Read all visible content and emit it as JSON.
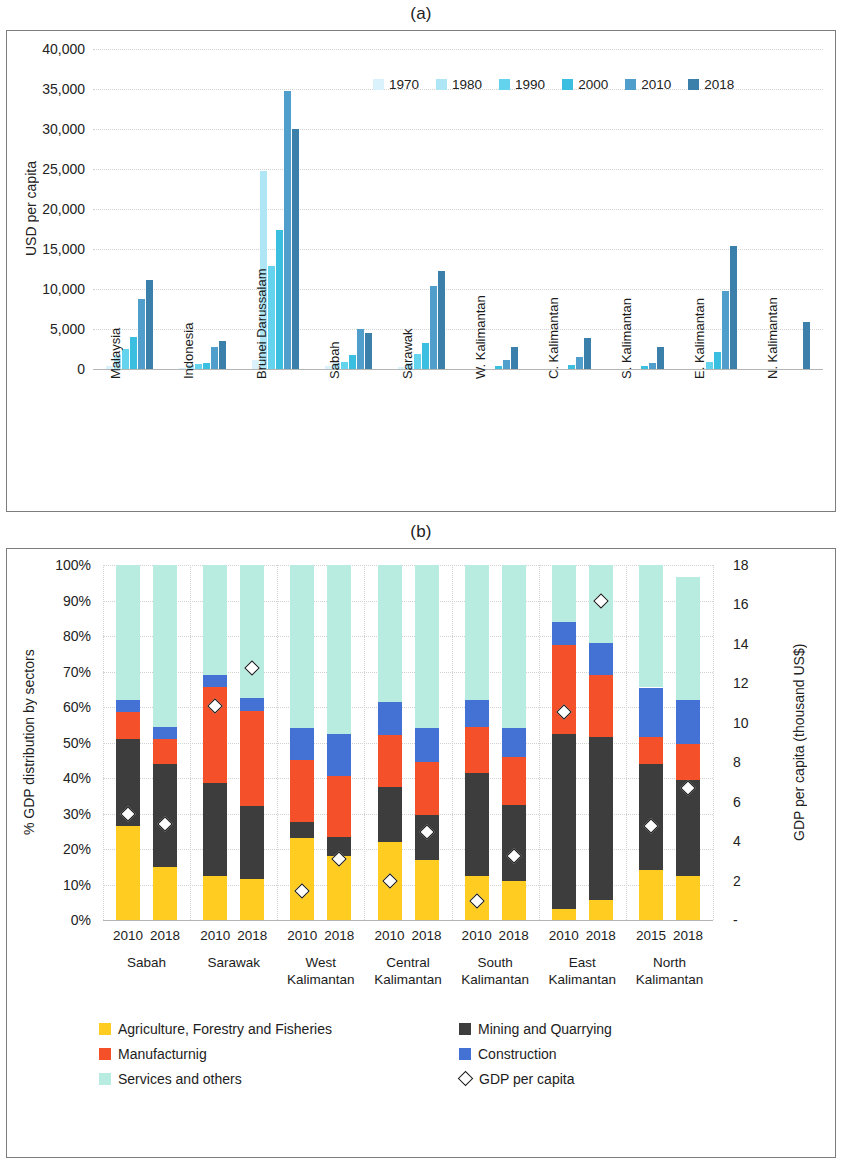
{
  "figure": {
    "panel_a_caption": "(a)",
    "panel_b_caption": "(b)"
  },
  "chart_data": [
    {
      "type": "bar",
      "id": "a",
      "title": "(a)",
      "xlabel": "",
      "ylabel": "USD per capita",
      "ylim": [
        0,
        40000
      ],
      "yticks": [
        "0",
        "5,000",
        "10,000",
        "15,000",
        "20,000",
        "25,000",
        "30,000",
        "35,000",
        "40,000"
      ],
      "ytick_values": [
        0,
        5000,
        10000,
        15000,
        20000,
        25000,
        30000,
        35000,
        40000
      ],
      "grid": true,
      "legend_position": "top-right",
      "categories": [
        "Malaysia",
        "Indonesia",
        "Brunei Darussalam",
        "Sabah",
        "Sarawak",
        "W. Kalimantan",
        "C. Kalimantan",
        "S. Kalimantan",
        "E. Kalimantan",
        "N. Kalimantan"
      ],
      "series": [
        {
          "name": "1970",
          "color": "#d9f2fb",
          "values": [
            390,
            80,
            1100,
            330,
            290,
            0,
            0,
            0,
            0,
            0
          ]
        },
        {
          "name": "1980",
          "color": "#aee6f5",
          "values": [
            1770,
            490,
            24700,
            700,
            720,
            0,
            0,
            0,
            0,
            0
          ]
        },
        {
          "name": "1990",
          "color": "#63d3ee",
          "values": [
            2440,
            580,
            12900,
            900,
            1900,
            0,
            0,
            0,
            900,
            0
          ]
        },
        {
          "name": "2000",
          "color": "#3bbfe0",
          "values": [
            4010,
            780,
            17400,
            1800,
            3200,
            350,
            500,
            380,
            2150,
            0
          ]
        },
        {
          "name": "2010",
          "color": "#4f9ecb",
          "values": [
            8760,
            2700,
            34700,
            5050,
            10400,
            1100,
            1500,
            700,
            9800,
            0
          ]
        },
        {
          "name": "2018",
          "color": "#3b7fab",
          "values": [
            11080,
            3500,
            30000,
            4550,
            12200,
            2700,
            3900,
            2700,
            15400,
            5900
          ]
        }
      ]
    },
    {
      "type": "bar",
      "id": "b",
      "title": "(b)",
      "stacked": true,
      "stack_mode": "percent",
      "ylabel": "% GDP distribution by sectors",
      "ylabel_secondary": "GDP per capita (thousand US$)",
      "ylim": [
        0,
        100
      ],
      "yticks": [
        "0%",
        "10%",
        "20%",
        "30%",
        "40%",
        "50%",
        "60%",
        "70%",
        "80%",
        "90%",
        "100%"
      ],
      "ytick_values": [
        0,
        10,
        20,
        30,
        40,
        50,
        60,
        70,
        80,
        90,
        100
      ],
      "ylim_secondary": [
        0,
        18
      ],
      "yticks_secondary": [
        "-",
        "2",
        "4",
        "6",
        "8",
        "10",
        "12",
        "14",
        "16",
        "18"
      ],
      "ytick_values_secondary": [
        0,
        2,
        4,
        6,
        8,
        10,
        12,
        14,
        16,
        18
      ],
      "grid": true,
      "regions": [
        {
          "name": "Sabah",
          "label_lines": [
            "Sabah"
          ]
        },
        {
          "name": "Sarawak",
          "label_lines": [
            "Sarawak"
          ]
        },
        {
          "name": "West Kalimantan",
          "label_lines": [
            "West",
            "Kalimantan"
          ]
        },
        {
          "name": "Central Kalimantan",
          "label_lines": [
            "Central",
            "Kalimantan"
          ]
        },
        {
          "name": "South Kalimantan",
          "label_lines": [
            "South",
            "Kalimantan"
          ]
        },
        {
          "name": "East Kalimantan",
          "label_lines": [
            "East",
            "Kalimantan"
          ]
        },
        {
          "name": "North Kalimantan",
          "label_lines": [
            "North",
            "Kalimantan"
          ]
        }
      ],
      "sectors": [
        {
          "name": "Agriculture, Forestry and Fisheries",
          "color": "#ffcc22"
        },
        {
          "name": "Mining and Quarrying",
          "color": "#3d3d3d"
        },
        {
          "name": "Manufacturnig",
          "color": "#f4502a"
        },
        {
          "name": "Construction",
          "color": "#4472d4"
        },
        {
          "name": "Services and others",
          "color": "#b9ece0"
        }
      ],
      "bars": [
        {
          "region": "Sabah",
          "year": "2010",
          "values": {
            "agriculture": 26.5,
            "mining": 24.5,
            "manufacturing": 7.5,
            "construction": 3.5,
            "services": 38.0
          },
          "gdp_per_capita": 5.7
        },
        {
          "region": "Sabah",
          "year": "2018",
          "values": {
            "agriculture": 15.0,
            "mining": 29.0,
            "manufacturing": 7.0,
            "construction": 3.5,
            "services": 45.5
          },
          "gdp_per_capita": 5.2
        },
        {
          "region": "Sarawak",
          "year": "2010",
          "values": {
            "agriculture": 12.5,
            "mining": 26.0,
            "manufacturing": 27.0,
            "construction": 3.5,
            "services": 31.0
          },
          "gdp_per_capita": 11.2
        },
        {
          "region": "Sarawak",
          "year": "2018",
          "values": {
            "agriculture": 11.5,
            "mining": 20.5,
            "manufacturing": 27.0,
            "construction": 3.5,
            "services": 37.5
          },
          "gdp_per_capita": 13.1
        },
        {
          "region": "West Kalimantan",
          "year": "2010",
          "values": {
            "agriculture": 23.0,
            "mining": 4.5,
            "manufacturing": 17.5,
            "construction": 9.0,
            "services": 46.0
          },
          "gdp_per_capita": 1.8
        },
        {
          "region": "West Kalimantan",
          "year": "2018",
          "values": {
            "agriculture": 18.0,
            "mining": 5.5,
            "manufacturing": 17.0,
            "construction": 12.0,
            "services": 47.5
          },
          "gdp_per_capita": 3.4
        },
        {
          "region": "Central Kalimantan",
          "year": "2010",
          "values": {
            "agriculture": 22.0,
            "mining": 15.5,
            "manufacturing": 14.5,
            "construction": 9.5,
            "services": 38.5
          },
          "gdp_per_capita": 2.3
        },
        {
          "region": "Central Kalimantan",
          "year": "2018",
          "values": {
            "agriculture": 17.0,
            "mining": 12.5,
            "manufacturing": 15.0,
            "construction": 9.5,
            "services": 46.0
          },
          "gdp_per_capita": 4.8
        },
        {
          "region": "South Kalimantan",
          "year": "2010",
          "values": {
            "agriculture": 12.5,
            "mining": 29.0,
            "manufacturing": 13.0,
            "construction": 7.5,
            "services": 38.0
          },
          "gdp_per_capita": 1.3
        },
        {
          "region": "South Kalimantan",
          "year": "2018",
          "values": {
            "agriculture": 11.0,
            "mining": 21.5,
            "manufacturing": 13.5,
            "construction": 8.0,
            "services": 46.0
          },
          "gdp_per_capita": 3.6
        },
        {
          "region": "East Kalimantan",
          "year": "2010",
          "values": {
            "agriculture": 3.0,
            "mining": 49.5,
            "manufacturing": 25.0,
            "construction": 6.5,
            "services": 16.0
          },
          "gdp_per_capita": 10.9
        },
        {
          "region": "East Kalimantan",
          "year": "2018",
          "values": {
            "agriculture": 5.5,
            "mining": 46.0,
            "manufacturing": 17.5,
            "construction": 9.0,
            "services": 22.0
          },
          "gdp_per_capita": 16.5
        },
        {
          "region": "North Kalimantan",
          "year": "2015",
          "values": {
            "agriculture": 14.0,
            "mining": 30.0,
            "manufacturing": 7.5,
            "construction": 14.0,
            "services": 34.5
          },
          "gdp_per_capita": 5.1
        },
        {
          "region": "North Kalimantan",
          "year": "2018",
          "values": {
            "agriculture": 12.5,
            "mining": 27.0,
            "manufacturing": 10.0,
            "construction": 12.5,
            "services": 34.5
          },
          "gdp_per_capita": 7.0
        }
      ],
      "legend_items": [
        {
          "label": "Agriculture, Forestry and Fisheries",
          "marker": "swatch",
          "color": "#ffcc22"
        },
        {
          "label": "Mining and Quarrying",
          "marker": "swatch",
          "color": "#3d3d3d"
        },
        {
          "label": "Manufacturnig",
          "marker": "swatch",
          "color": "#f4502a"
        },
        {
          "label": "Construction",
          "marker": "swatch",
          "color": "#4472d4"
        },
        {
          "label": "Services and others",
          "marker": "swatch",
          "color": "#b9ece0"
        },
        {
          "label": "GDP per capita",
          "marker": "diamond",
          "color": "#ffffff"
        }
      ]
    }
  ]
}
